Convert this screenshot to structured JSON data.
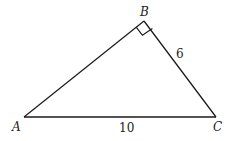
{
  "diagram": {
    "type": "right-triangle",
    "vertices": {
      "A": {
        "label": "A",
        "x": 24,
        "y": 117
      },
      "B": {
        "label": "B",
        "x": 144,
        "y": 21
      },
      "C": {
        "label": "C",
        "x": 216,
        "y": 117
      }
    },
    "right_angle_at": "B",
    "side_labels": {
      "BC": "6",
      "AC": "10"
    },
    "stroke_color": "#1a1a1a",
    "text_color": "#222222"
  }
}
